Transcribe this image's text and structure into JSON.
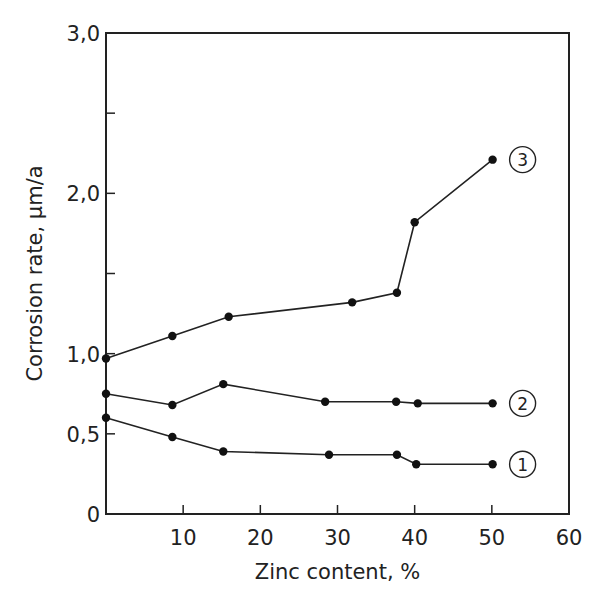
{
  "chart_data": {
    "type": "line",
    "title": "",
    "xlabel": "Zinc content, %",
    "ylabel": "Corrosion rate, µm/a",
    "xlim": [
      0,
      60
    ],
    "ylim": [
      0,
      3.0
    ],
    "x_ticks": [
      "10",
      "20",
      "30",
      "40",
      "50",
      "60"
    ],
    "y_ticks": [
      "0",
      "0,5",
      "1,0",
      "2,0",
      "3,0"
    ],
    "grid": false,
    "legend_position": "inline circled labels at right end of each curve",
    "series": [
      {
        "name": "1",
        "x": [
          0,
          8.6,
          15.2,
          28.9,
          37.7,
          40.2,
          50.1
        ],
        "y": [
          0.6,
          0.48,
          0.39,
          0.37,
          0.37,
          0.31,
          0.31
        ]
      },
      {
        "name": "2",
        "x": [
          0,
          8.6,
          15.2,
          28.4,
          37.6,
          40.4,
          50.1
        ],
        "y": [
          0.75,
          0.68,
          0.81,
          0.7,
          0.7,
          0.69,
          0.69
        ]
      },
      {
        "name": "3",
        "x": [
          0,
          8.6,
          15.9,
          31.9,
          37.7,
          40.0,
          50.1
        ],
        "y": [
          0.97,
          1.11,
          1.23,
          1.32,
          1.38,
          1.82,
          2.21
        ]
      }
    ]
  }
}
